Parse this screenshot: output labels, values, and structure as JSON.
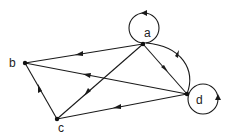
{
  "diagram": {
    "type": "directed-graph",
    "nodes": [
      {
        "id": "a",
        "label": "a",
        "x": 143,
        "y": 44,
        "label_x": 144,
        "label_y": 37
      },
      {
        "id": "b",
        "label": "b",
        "x": 25,
        "y": 63,
        "label_x": 9,
        "label_y": 67
      },
      {
        "id": "c",
        "label": "c",
        "x": 57,
        "y": 119,
        "label_x": 58,
        "label_y": 132
      },
      {
        "id": "d",
        "label": "d",
        "x": 187,
        "y": 94,
        "label_x": 196,
        "label_y": 104
      }
    ],
    "edges": [
      {
        "from": "a",
        "to": "a",
        "kind": "self-loop",
        "position": "top"
      },
      {
        "from": "a",
        "to": "b",
        "kind": "straight"
      },
      {
        "from": "a",
        "to": "c",
        "kind": "straight"
      },
      {
        "from": "a",
        "to": "d",
        "kind": "straight"
      },
      {
        "from": "d",
        "to": "a",
        "kind": "curved"
      },
      {
        "from": "d",
        "to": "b",
        "kind": "straight"
      },
      {
        "from": "d",
        "to": "c",
        "kind": "straight"
      },
      {
        "from": "c",
        "to": "b",
        "kind": "straight"
      },
      {
        "from": "d",
        "to": "d",
        "kind": "self-loop",
        "position": "right"
      }
    ]
  }
}
